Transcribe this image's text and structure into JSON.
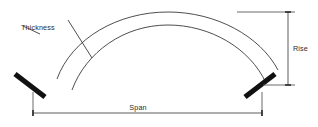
{
  "diagram": {
    "type": "engineering-line-drawing",
    "background_color": "#ffffff",
    "line_color": "#3a3a3a",
    "skewback_color": "#111111",
    "labels": {
      "thickness": "Thickness",
      "span": "Span",
      "rise": "Rise"
    },
    "geometry": {
      "extrados": {
        "start_x": 57,
        "start_y": 78,
        "crown_x": 168,
        "crown_y": 12,
        "end_x": 278,
        "end_y": 70
      },
      "intrados": {
        "start_x": 72,
        "start_y": 89,
        "crown_x": 168,
        "crown_y": 24,
        "end_x": 266,
        "end_y": 83
      },
      "skewback_left": {
        "x1": 14,
        "y1": 74,
        "x2": 45,
        "y2": 97
      },
      "skewback_right": {
        "x1": 245,
        "y1": 97,
        "x2": 275,
        "y2": 74
      },
      "span_dimension": {
        "y": 113,
        "x_left": 33,
        "x_right": 262
      },
      "rise_dimension": {
        "x": 288,
        "y_top": 12,
        "y_bottom": 85
      }
    }
  }
}
